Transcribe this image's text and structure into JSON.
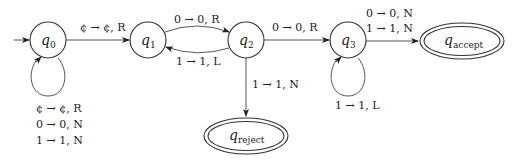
{
  "diagram": {
    "type": "turing-machine-state-diagram",
    "states": [
      {
        "id": "q0",
        "name": "q",
        "sub": "0",
        "start": true,
        "final": false
      },
      {
        "id": "q1",
        "name": "q",
        "sub": "1",
        "start": false,
        "final": false
      },
      {
        "id": "q2",
        "name": "q",
        "sub": "2",
        "start": false,
        "final": false
      },
      {
        "id": "q3",
        "name": "q",
        "sub": "3",
        "start": false,
        "final": false
      },
      {
        "id": "qaccept",
        "name": "q",
        "sub": "accept",
        "start": false,
        "final": true
      },
      {
        "id": "qreject",
        "name": "q",
        "sub": "reject",
        "start": false,
        "final": true
      }
    ],
    "transitions": {
      "q0_q0": [
        "¢ → ¢, R",
        "0 → 0, N",
        "1 → 1, N"
      ],
      "q0_q1": [
        "¢ → ¢, R"
      ],
      "q1_q2": [
        "0 → 0, R"
      ],
      "q2_q1": [
        "1 → 1, L"
      ],
      "q2_q3": [
        "0 → 0, R"
      ],
      "q2_qreject": [
        "1 → 1, N"
      ],
      "q3_q3": [
        "1 → 1, L"
      ],
      "q3_qaccept": [
        "0 → 0, N",
        "1 → 1, N"
      ]
    }
  }
}
